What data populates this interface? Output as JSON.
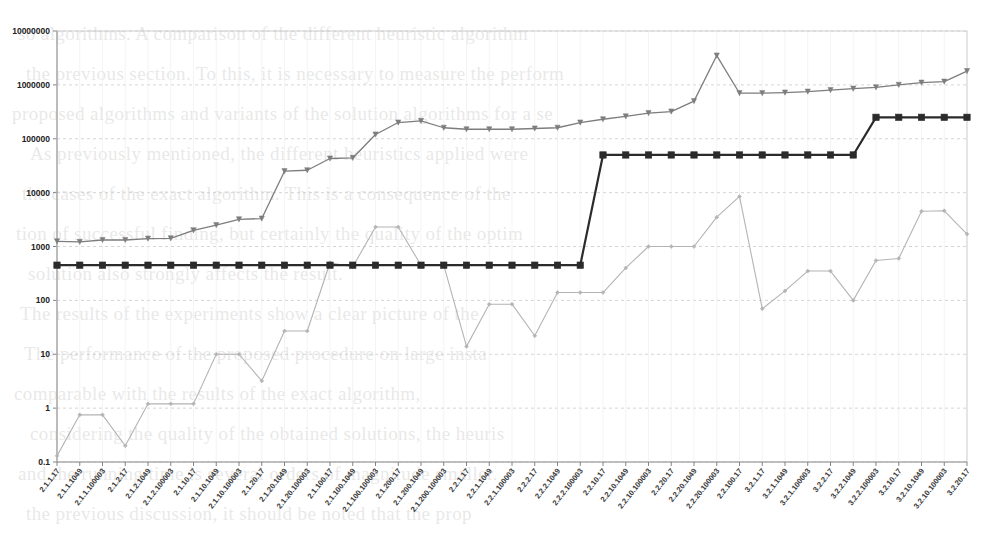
{
  "chart_data": {
    "type": "line",
    "title": "",
    "xlabel": "",
    "ylabel": "",
    "yscale": "log",
    "ylim": [
      0.1,
      10000000
    ],
    "grid": true,
    "legend": "none",
    "ytick_labels": [
      "10000000",
      "1000000",
      "100000",
      "10000",
      "1000",
      "100",
      "10",
      "1",
      "0.1"
    ],
    "ytick_values": [
      10000000,
      1000000,
      100000,
      10000,
      1000,
      100,
      10,
      1,
      0.1
    ],
    "categories": [
      "2.1.1.17",
      "2.1.1.1049",
      "2.1.1.100003",
      "2.1.2.17",
      "2.1.2.1049",
      "2.1.2.100003",
      "2.1.10.17",
      "2.1.10.1049",
      "2.1.10.100003",
      "2.1.20.17",
      "2.1.20.1049",
      "2.1.20.100003",
      "2.1.100.17",
      "2.1.100.1049",
      "2.1.100.100003",
      "2.1.200.17",
      "2.1.200.1049",
      "2.1.200.100003",
      "2.2.1.17",
      "2.2.1.1049",
      "2.2.1.100003",
      "2.2.2.17",
      "2.2.2.1049",
      "2.2.2.100003",
      "2.2.10.17",
      "2.2.10.1049",
      "2.2.10.100003",
      "2.2.20.17",
      "2.2.20.1049",
      "2.2.20.100003",
      "2.2.100.17",
      "3.2.1.17",
      "3.2.1.1049",
      "3.2.1.100003",
      "3.2.2.17",
      "3.2.2.1049",
      "3.2.2.100003",
      "3.2.10.17",
      "3.2.10.1049",
      "3.2.10.100003",
      "3.2.20.17"
    ],
    "series": [
      {
        "name": "upper-series",
        "color": "#7d7d7d",
        "marker": "triangle",
        "values": [
          1250,
          1220,
          1320,
          1320,
          1400,
          1420,
          2000,
          2500,
          3200,
          3300,
          25000,
          26000,
          43000,
          44000,
          120000,
          200000,
          215000,
          160000,
          150000,
          150000,
          150000,
          155000,
          160000,
          200000,
          230000,
          260000,
          300000,
          320000,
          500000,
          3500000,
          700000,
          700000,
          720000,
          750000,
          800000,
          850000,
          900000,
          1000000,
          1100000,
          1150000,
          1800000
        ]
      },
      {
        "name": "step-series",
        "color": "#2b2b2b",
        "marker": "square",
        "values": [
          450,
          450,
          450,
          450,
          450,
          450,
          450,
          450,
          450,
          450,
          450,
          450,
          450,
          450,
          450,
          450,
          450,
          450,
          450,
          450,
          450,
          450,
          450,
          450,
          50000,
          50000,
          50000,
          50000,
          50000,
          50000,
          50000,
          50000,
          50000,
          50000,
          50000,
          50000,
          250000,
          250000,
          250000,
          250000,
          250000
        ]
      },
      {
        "name": "lower-series",
        "color": "#b4b4b4",
        "marker": "diamond",
        "values": [
          0.13,
          0.75,
          0.75,
          0.2,
          1.2,
          1.2,
          1.2,
          10,
          10,
          3.2,
          27,
          27,
          500,
          420,
          2300,
          2300,
          450,
          450,
          14,
          85,
          85,
          22,
          140,
          140,
          140,
          400,
          1000,
          1000,
          1000,
          3500,
          8500,
          70,
          150,
          350,
          350,
          100,
          550,
          600,
          4500,
          4600,
          1700
        ]
      }
    ]
  },
  "bleed_text": {
    "lines": [
      "so algorithms. A comparison of the different heuristic algorithm",
      "the previous section. To this, it is necessary to measure the perform",
      "proposed algorithms and variants of the solution algorithms for a se",
      "As previously mentioned, the different heuristics applied were",
      "the cases of the exact algorithm. This is a consequence of the",
      "tion of successful finding, but certainly the quality of the optim",
      "solution also strongly affects the result.",
      "The results of the experiments show a clear picture of the",
      "The performance of the proposed procedure on large insta",
      "comparable with the results of the exact algorithm,",
      "considering the quality of the obtained solutions, the heuris",
      "and the running time is several orders of magnitude smaller.",
      "the previous discussion, it should be noted that the prop"
    ]
  }
}
